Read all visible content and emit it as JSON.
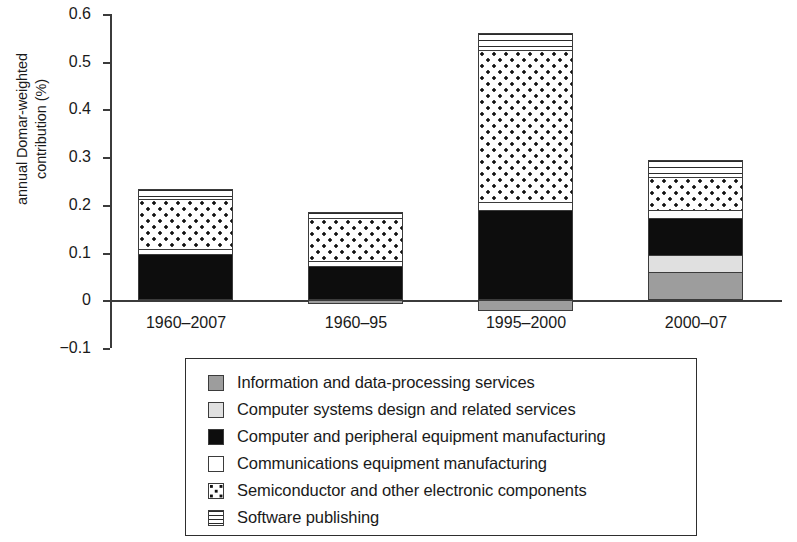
{
  "chart_data": {
    "type": "bar",
    "subtype": "stacked-bar",
    "title": "",
    "xlabel": "",
    "ylabel": "annual Domar-weighted contribution (%)",
    "ylim": [
      -0.1,
      0.6
    ],
    "yticks": [
      "0.6",
      "0.5",
      "0.4",
      "0.3",
      "0.2",
      "0.1",
      "0",
      "−0.1"
    ],
    "ytick_values": [
      0.6,
      0.5,
      0.4,
      0.3,
      0.2,
      0.1,
      0,
      -0.1
    ],
    "grid": false,
    "legend_position": "below",
    "categories": [
      "1960–2007",
      "1960–95",
      "1995–2000",
      "2000–07"
    ],
    "series": [
      {
        "name": "Information and data-processing services",
        "key": "info",
        "fill": "solid-medium-gray",
        "color": "#9d9d9d",
        "values": [
          0.0,
          -0.008,
          -0.022,
          0.059
        ]
      },
      {
        "name": "Computer systems design and related services",
        "key": "csd",
        "fill": "solid-light-gray",
        "color": "#e0e0e0",
        "values": [
          0.0,
          0.0,
          0.0,
          0.035
        ]
      },
      {
        "name": "Computer and peripheral equipment manufacturing",
        "key": "cpe",
        "fill": "solid-black",
        "color": "#0d0d0d",
        "values": [
          0.097,
          0.072,
          0.19,
          0.078
        ]
      },
      {
        "name": "Communications equipment manufacturing",
        "key": "comm",
        "fill": "solid-white",
        "color": "#ffffff",
        "values": [
          0.01,
          0.01,
          0.015,
          0.017
        ]
      },
      {
        "name": "Semiconductor and other electronic components",
        "key": "semi",
        "fill": "dotted",
        "color": "#ffffff",
        "values": [
          0.105,
          0.09,
          0.32,
          0.07
        ]
      },
      {
        "name": "Software publishing",
        "key": "soft",
        "fill": "horizontal-stripes",
        "color": "#ffffff",
        "values": [
          0.021,
          0.013,
          0.035,
          0.035
        ]
      }
    ],
    "totals_positive": [
      0.233,
      0.185,
      0.56,
      0.294
    ],
    "totals_negative": [
      0.0,
      -0.008,
      -0.022,
      0.0
    ]
  }
}
